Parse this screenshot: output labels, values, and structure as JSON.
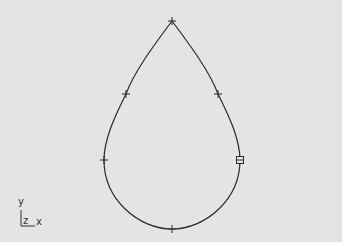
{
  "viewport": {
    "background": "#e4e4e4",
    "curve_color": "#2a2a2a"
  },
  "curve": {
    "type": "closed-spline",
    "shape": "teardrop",
    "knots": [
      {
        "x": 172,
        "y": 21,
        "marker": "plus"
      },
      {
        "x": 218,
        "y": 94,
        "marker": "plus"
      },
      {
        "x": 240,
        "y": 160,
        "marker": "square-grip"
      },
      {
        "x": 172,
        "y": 229,
        "marker": "plus"
      },
      {
        "x": 104,
        "y": 160,
        "marker": "plus"
      },
      {
        "x": 126,
        "y": 94,
        "marker": "plus"
      }
    ]
  },
  "axis_triad": {
    "y_label": "y",
    "z_label": "z",
    "x_label": "x"
  }
}
